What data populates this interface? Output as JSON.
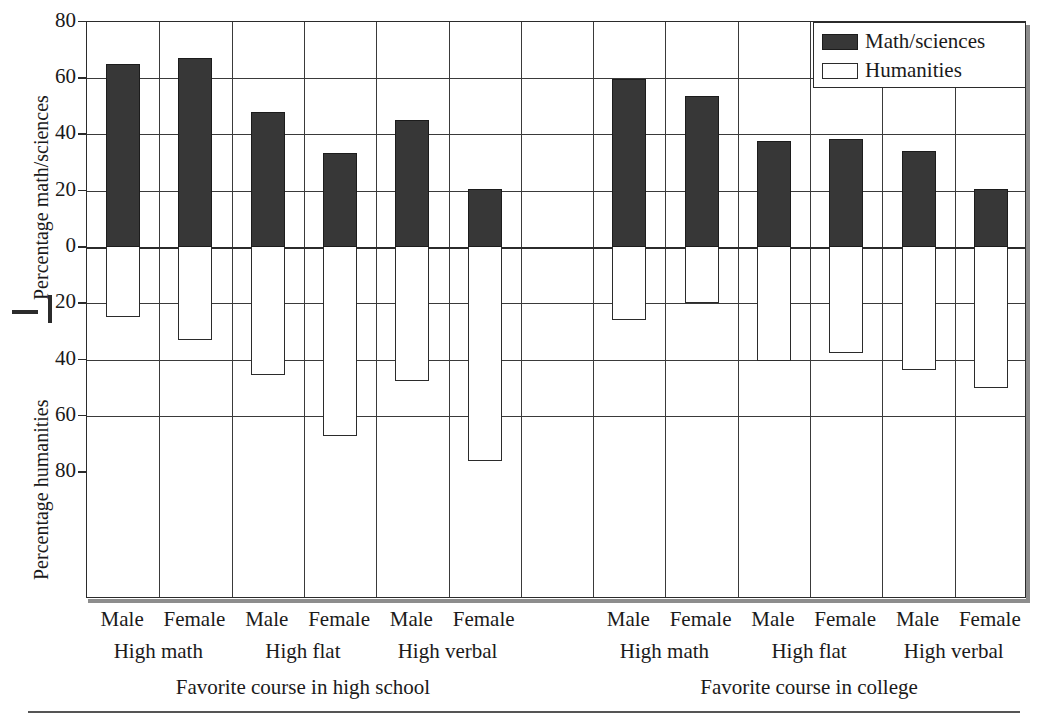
{
  "axes": {
    "y_top_label": "Percentage math/sciences",
    "y_bottom_label": "Percentage humanities",
    "y_ticks_top": [
      "80",
      "60",
      "40",
      "20",
      "0"
    ],
    "y_ticks_bottom": [
      "20",
      "40",
      "60",
      "80"
    ]
  },
  "legend": {
    "items": [
      {
        "label": "Math/sciences",
        "swatch": "filled-dark",
        "color": "#373737"
      },
      {
        "label": "Humanities",
        "swatch": "open-white",
        "color": "#ffffff"
      }
    ]
  },
  "panels": [
    {
      "label": "Favorite course in high school"
    },
    {
      "label": "Favorite course in college"
    }
  ],
  "groups": [
    {
      "label": "High math"
    },
    {
      "label": "High flat"
    },
    {
      "label": "High verbal"
    },
    {
      "label": "High math"
    },
    {
      "label": "High flat"
    },
    {
      "label": "High verbal"
    }
  ],
  "categories": [
    "Male",
    "Female",
    "Male",
    "Female",
    "Male",
    "Female",
    "Male",
    "Female",
    "Male",
    "Female",
    "Male",
    "Female"
  ],
  "chart_data": {
    "type": "bar",
    "title": "",
    "xlabel": "",
    "ylabel": "Percentage math/sciences / Percentage humanities",
    "ylim": [
      -80,
      80
    ],
    "grid": true,
    "legend_position": "top-right",
    "panels": [
      "Favorite course in high school",
      "Favorite course in college"
    ],
    "groups": [
      "High math",
      "High flat",
      "High verbal",
      "High math",
      "High flat",
      "High verbal"
    ],
    "categories": [
      "Male",
      "Female",
      "Male",
      "Female",
      "Male",
      "Female",
      "Male",
      "Female",
      "Male",
      "Female",
      "Male",
      "Female"
    ],
    "series": [
      {
        "name": "Math/sciences",
        "direction": "up",
        "values": [
          65,
          67,
          48,
          33.5,
          45,
          20.5,
          59.5,
          53.5,
          37.5,
          38.5,
          34,
          20.5
        ]
      },
      {
        "name": "Humanities",
        "direction": "down",
        "values": [
          25,
          33,
          45.5,
          67,
          47.5,
          76,
          26,
          20,
          40.5,
          37.5,
          43.5,
          50
        ]
      }
    ]
  }
}
